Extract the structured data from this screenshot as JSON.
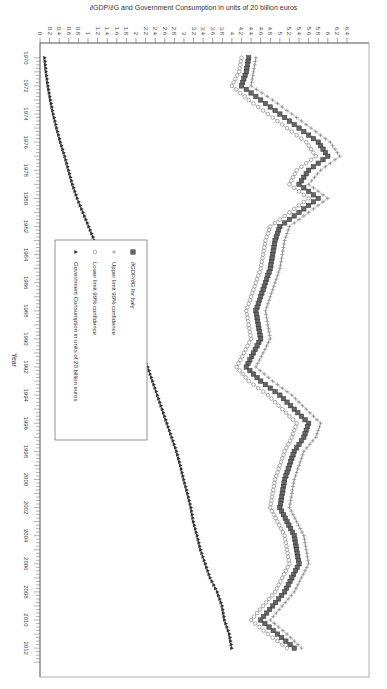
{
  "chart_data": {
    "type": "line",
    "title": "",
    "xlabel": "Year",
    "ylabel": "∂GDP/∂G and Government Consumption in units of 20 billion euros",
    "xlim": [
      1970,
      2012.5
    ],
    "ylim": [
      0,
      6.4
    ],
    "x_ticks": [
      1970,
      1972,
      1974,
      1976,
      1978,
      1980,
      1982,
      1984,
      1986,
      1988,
      1990,
      1992,
      1994,
      1996,
      1998,
      2000,
      2002,
      2004,
      2006,
      2008,
      2010,
      2012
    ],
    "y_ticks": [
      0,
      0.2,
      0.4,
      0.6,
      0.8,
      1,
      1.2,
      1.4,
      1.6,
      1.8,
      2,
      2.2,
      2.4,
      2.6,
      2.8,
      3,
      3.2,
      3.4,
      3.6,
      3.8,
      4,
      4.2,
      4.4,
      4.6,
      4.8,
      5,
      5.2,
      5.4,
      5.6,
      5.8,
      6,
      6.2,
      6.4
    ],
    "grid": false,
    "legend_position": "inside-lower-center",
    "x": [
      1970,
      1971,
      1972,
      1973,
      1974,
      1975,
      1976,
      1977,
      1978,
      1979,
      1980,
      1981,
      1982,
      1983,
      1984,
      1985,
      1986,
      1987,
      1988,
      1989,
      1990,
      1991,
      1992,
      1993,
      1994,
      1995,
      1996,
      1997,
      1998,
      1999,
      2000,
      2001,
      2002,
      2003,
      2004,
      2005,
      2006,
      2007,
      2008,
      2009,
      2010,
      2011,
      2012
    ],
    "series": [
      {
        "name": "∂GDP/∂G for Italy",
        "marker": "square",
        "values": [
          4.35,
          4.3,
          4.2,
          4.6,
          5.0,
          5.4,
          5.8,
          6.0,
          5.6,
          5.4,
          5.8,
          5.4,
          5.0,
          4.9,
          4.85,
          4.8,
          4.7,
          4.6,
          4.5,
          4.55,
          4.6,
          4.45,
          4.3,
          4.6,
          5.0,
          5.3,
          5.6,
          5.5,
          5.3,
          5.2,
          5.1,
          5.05,
          5.0,
          5.15,
          5.3,
          5.35,
          5.4,
          5.25,
          5.1,
          4.85,
          4.6,
          4.95,
          5.3
        ]
      },
      {
        "name": "Upper limit 99% confidence",
        "marker": "plus",
        "values": [
          4.5,
          4.45,
          4.4,
          4.85,
          5.25,
          5.65,
          6.05,
          6.25,
          5.85,
          5.6,
          6.0,
          5.6,
          5.2,
          5.1,
          5.05,
          5.0,
          4.9,
          4.8,
          4.7,
          4.75,
          4.8,
          4.65,
          4.5,
          4.85,
          5.25,
          5.55,
          5.85,
          5.75,
          5.5,
          5.4,
          5.3,
          5.25,
          5.2,
          5.35,
          5.5,
          5.55,
          5.6,
          5.45,
          5.3,
          5.05,
          4.8,
          5.15,
          5.45
        ]
      },
      {
        "name": "Lower limit 99% confidence",
        "marker": "circle",
        "values": [
          4.2,
          4.15,
          4.0,
          4.35,
          4.75,
          5.15,
          5.55,
          5.75,
          5.35,
          5.2,
          5.6,
          5.2,
          4.8,
          4.7,
          4.65,
          4.6,
          4.5,
          4.4,
          4.3,
          4.35,
          4.4,
          4.25,
          4.1,
          4.35,
          4.75,
          5.05,
          5.35,
          5.25,
          5.1,
          5.0,
          4.9,
          4.85,
          4.8,
          4.95,
          5.1,
          5.15,
          5.2,
          5.05,
          4.9,
          4.65,
          4.4,
          4.75,
          5.15
        ]
      },
      {
        "name": "Government Consumption in units of 20 billion euros",
        "marker": "triangle",
        "values": [
          0.1,
          0.13,
          0.17,
          0.22,
          0.28,
          0.35,
          0.43,
          0.52,
          0.6,
          0.68,
          0.78,
          0.9,
          1.02,
          1.14,
          1.25,
          1.38,
          1.5,
          1.62,
          1.75,
          1.88,
          2.0,
          2.12,
          2.25,
          2.35,
          2.45,
          2.55,
          2.65,
          2.75,
          2.85,
          2.93,
          3.0,
          3.08,
          3.15,
          3.2,
          3.28,
          3.35,
          3.45,
          3.55,
          3.7,
          3.8,
          3.85,
          3.95,
          4.0
        ]
      }
    ]
  },
  "legend": {
    "items": [
      {
        "label": "∂GDP/∂G for Italy",
        "marker": "square"
      },
      {
        "label": "Upper limit 99% confidence",
        "marker": "plus"
      },
      {
        "label": "Lower limit 99% confidence",
        "marker": "circle"
      },
      {
        "label": "Government Consumption in units of 20 billion euros",
        "marker": "triangle"
      }
    ]
  },
  "colors": {
    "series_marker": "#555555",
    "line": "#888888",
    "gc_line": "#222222",
    "axis": "#666666"
  }
}
